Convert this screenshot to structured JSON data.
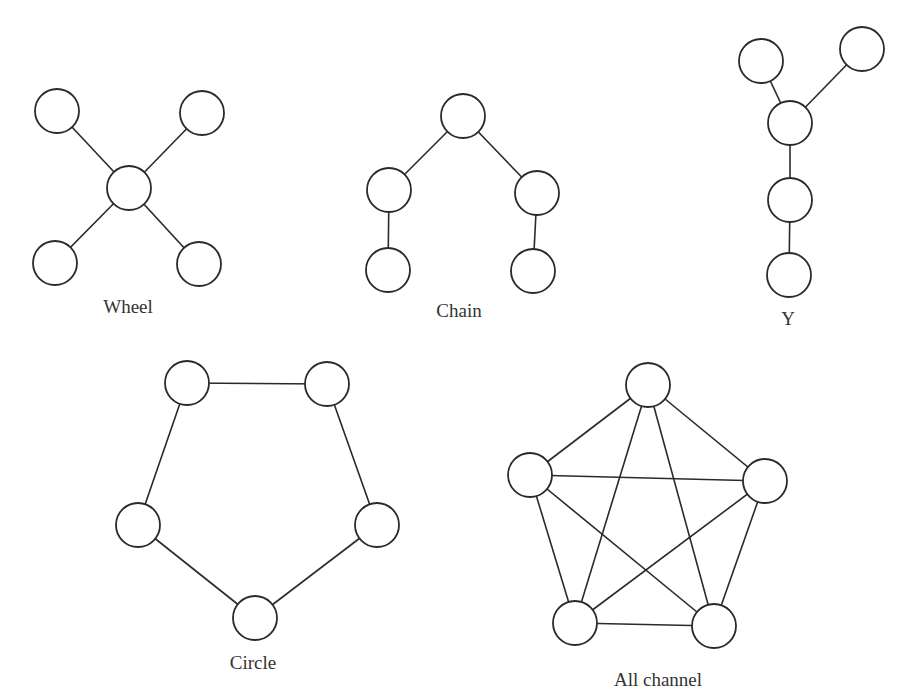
{
  "diagram": {
    "node_radius": 22,
    "colors": {
      "stroke": "#2a2a2a",
      "fill": "#ffffff",
      "text": "#333333"
    },
    "networks": [
      {
        "id": "wheel",
        "label": "Wheel",
        "label_pos": [
          128,
          296
        ],
        "nodes": [
          [
            57,
            111
          ],
          [
            202,
            113
          ],
          [
            129,
            188
          ],
          [
            55,
            263
          ],
          [
            199,
            264
          ]
        ],
        "edges": [
          [
            0,
            2
          ],
          [
            1,
            2
          ],
          [
            3,
            2
          ],
          [
            4,
            2
          ]
        ]
      },
      {
        "id": "chain",
        "label": "Chain",
        "label_pos": [
          459,
          300
        ],
        "nodes": [
          [
            463,
            116
          ],
          [
            389,
            190
          ],
          [
            537,
            193
          ],
          [
            388,
            270
          ],
          [
            533,
            271
          ]
        ],
        "edges": [
          [
            0,
            1
          ],
          [
            0,
            2
          ],
          [
            1,
            3
          ],
          [
            2,
            4
          ]
        ]
      },
      {
        "id": "y",
        "label": "Y",
        "label_pos": [
          788,
          308
        ],
        "nodes": [
          [
            761,
            61
          ],
          [
            862,
            49
          ],
          [
            790,
            123
          ],
          [
            790,
            200
          ],
          [
            789,
            275
          ]
        ],
        "edges": [
          [
            0,
            2
          ],
          [
            1,
            2
          ],
          [
            2,
            3
          ],
          [
            3,
            4
          ]
        ]
      },
      {
        "id": "circle",
        "label": "Circle",
        "label_pos": [
          253,
          652
        ],
        "nodes": [
          [
            187,
            383
          ],
          [
            327,
            384
          ],
          [
            377,
            525
          ],
          [
            255,
            618
          ],
          [
            138,
            525
          ]
        ],
        "edges": [
          [
            0,
            1
          ],
          [
            1,
            2
          ],
          [
            2,
            3
          ],
          [
            3,
            4
          ],
          [
            4,
            0
          ]
        ]
      },
      {
        "id": "all-channel",
        "label": "All channel",
        "label_pos": [
          658,
          669
        ],
        "nodes": [
          [
            648,
            385
          ],
          [
            765,
            481
          ],
          [
            714,
            626
          ],
          [
            575,
            623
          ],
          [
            530,
            475
          ]
        ],
        "edges": [
          [
            0,
            1
          ],
          [
            0,
            2
          ],
          [
            0,
            3
          ],
          [
            0,
            4
          ],
          [
            1,
            2
          ],
          [
            1,
            3
          ],
          [
            1,
            4
          ],
          [
            2,
            3
          ],
          [
            2,
            4
          ],
          [
            3,
            4
          ]
        ]
      }
    ]
  }
}
